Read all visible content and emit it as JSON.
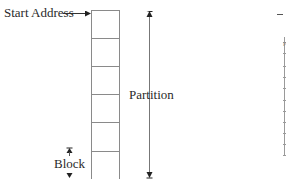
{
  "diagram": {
    "labels": {
      "start_address": "Start Address",
      "partition": "Partition",
      "block": "Block",
      "right_partial": "P"
    },
    "partition_box": {
      "x": 91,
      "top": 10,
      "width": 28,
      "bottom": 179,
      "divider_ys": [
        38,
        66,
        94,
        122,
        151
      ],
      "stroke": "#8a8a8a"
    },
    "partition_arrow": {
      "x": 149,
      "top": 10,
      "bottom": 178
    },
    "block_arrow": {
      "x": 69,
      "top": 147,
      "bottom": 178
    },
    "start_arrow": {
      "from_x": 63,
      "to_x": 91,
      "y": 13
    },
    "right_fragment": {
      "dash": {
        "x1": 277,
        "x2": 283,
        "y": 14
      },
      "axis_x": 284,
      "axis_top": 37,
      "axis_bottom": 155,
      "tick_ys": [
        42,
        53,
        66,
        77,
        88,
        100,
        111,
        122,
        133,
        144,
        155
      ]
    }
  }
}
